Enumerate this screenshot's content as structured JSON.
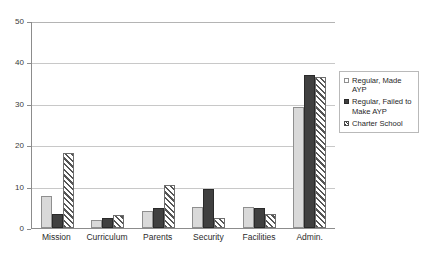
{
  "chart_data": {
    "type": "bar",
    "title": "",
    "subtitle": "",
    "xlabel": "",
    "ylabel": "",
    "ylim": [
      0,
      50
    ],
    "yticks": [
      0,
      10,
      20,
      30,
      40,
      50
    ],
    "grid": true,
    "legend_position": "right",
    "categories": [
      "Mission",
      "Curriculum",
      "Parents",
      "Security",
      "Facilities",
      "Admin."
    ],
    "series": [
      {
        "name": "Regular, Made AYP",
        "color": "#d9d9d9",
        "pattern": "solid",
        "values": [
          7.8,
          1.9,
          4.2,
          5.0,
          5.0,
          29.2
        ]
      },
      {
        "name": "Regular, Failed to Make AYP",
        "color": "#404040",
        "pattern": "solid",
        "values": [
          3.3,
          2.3,
          4.8,
          9.5,
          4.8,
          37.0
        ]
      },
      {
        "name": "Charter School",
        "color": "#ffffff",
        "pattern": "diagonal-hatch",
        "values": [
          18.0,
          3.1,
          10.3,
          2.3,
          3.5,
          36.5
        ]
      }
    ]
  },
  "legend": {
    "items": [
      {
        "label": "Regular, Made AYP"
      },
      {
        "label": "Regular, Failed to Make AYP"
      },
      {
        "label": "Charter School"
      }
    ]
  },
  "axes": {
    "y_tick_labels": [
      "50",
      "40",
      "30",
      "20",
      "10",
      "0"
    ],
    "x_tick_labels": [
      "Mission",
      "Curriculum",
      "Parents",
      "Security",
      "Facilities",
      "Admin."
    ]
  }
}
